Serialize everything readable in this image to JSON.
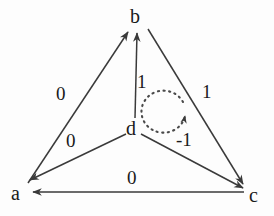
{
  "diagram": {
    "stroke_color": "#3a3a3a",
    "text_color": "#1a1a1a",
    "background_color": "#fdfdfd",
    "nodes": [
      {
        "id": "a",
        "label": "a",
        "x": 18,
        "y": 193
      },
      {
        "id": "b",
        "label": "b",
        "x": 137,
        "y": 18
      },
      {
        "id": "c",
        "label": "c",
        "x": 253,
        "y": 195
      },
      {
        "id": "d",
        "label": "d",
        "x": 133,
        "y": 128
      }
    ],
    "edges": [
      {
        "id": "a-to-b",
        "from": "a",
        "to": "b",
        "weight": "0",
        "label_x": 62,
        "label_y": 86
      },
      {
        "id": "d-to-b",
        "from": "d",
        "to": "b",
        "weight": "1",
        "label_x": 140,
        "label_y": 74
      },
      {
        "id": "b-to-c",
        "from": "b",
        "to": "c",
        "weight": "1",
        "label_x": 203,
        "label_y": 84
      },
      {
        "id": "d-to-a",
        "from": "d",
        "to": "a",
        "weight": "0",
        "label_x": 70,
        "label_y": 134
      },
      {
        "id": "d-to-c",
        "from": "d",
        "to": "c",
        "weight": "-1",
        "label_x": 179,
        "label_y": 132
      },
      {
        "id": "c-to-a",
        "from": "c",
        "to": "a",
        "weight": "0",
        "label_x": 131,
        "label_y": 170
      }
    ],
    "self_loop": {
      "id": "d-self-loop",
      "node": "d",
      "style": "dotted",
      "direction": "clockwise",
      "weight": null
    }
  }
}
